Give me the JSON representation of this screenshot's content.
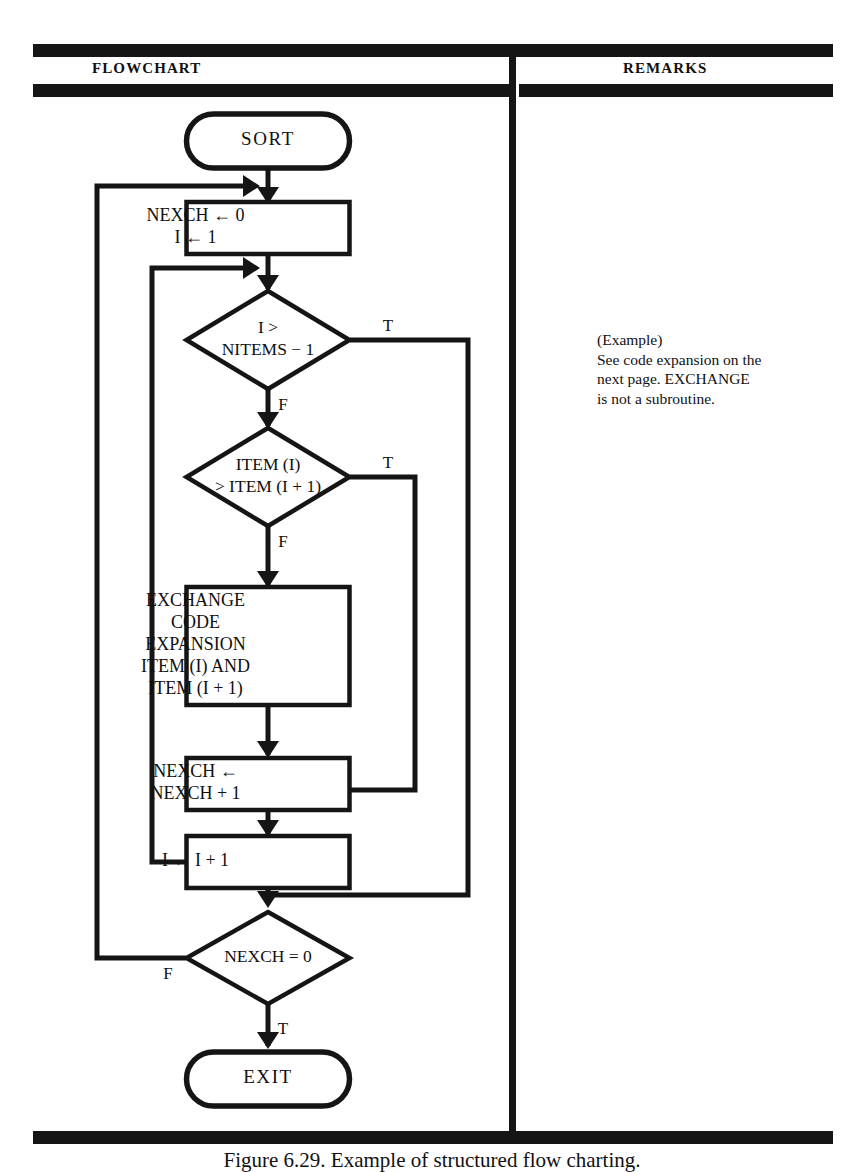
{
  "page": {
    "width": 864,
    "height": 1172,
    "background": "#ffffff",
    "ink_color": "#151515"
  },
  "columns": {
    "flowchart_title": "FLOWCHART",
    "remarks_title": "REMARKS"
  },
  "remarks": {
    "lines": [
      "(Example)",
      "See code expansion on the",
      "next page.  EXCHANGE",
      "is not a subroutine."
    ]
  },
  "figure": {
    "caption": "Figure 6.29.  Example of structured flow charting."
  },
  "chart_data": {
    "type": "diagram",
    "diagram_kind": "flowchart",
    "title": "FLOWCHART",
    "nodes": [
      {
        "id": "start",
        "shape": "terminal",
        "lines": [
          "SORT"
        ],
        "cx": 268,
        "cy": 141,
        "w": 163,
        "h": 54
      },
      {
        "id": "init",
        "shape": "process",
        "lines": [
          "NEXCH ← 0",
          "I ← 1"
        ],
        "cx": 268,
        "cy": 228,
        "w": 163,
        "h": 52
      },
      {
        "id": "loop-test",
        "shape": "decision",
        "lines": [
          "I >",
          "NITEMS − 1"
        ],
        "cx": 268,
        "cy": 340,
        "w": 163,
        "h": 98
      },
      {
        "id": "compare",
        "shape": "decision",
        "lines": [
          "ITEM (I)",
          "> ITEM (I + 1)"
        ],
        "cx": 268,
        "cy": 477,
        "w": 163,
        "h": 98
      },
      {
        "id": "exchange",
        "shape": "process",
        "lines": [
          "EXCHANGE",
          "CODE",
          "EXPANSION",
          "ITEM (I) AND",
          "ITEM (I + 1)"
        ],
        "cx": 268,
        "cy": 646,
        "w": 163,
        "h": 118
      },
      {
        "id": "count",
        "shape": "process",
        "lines": [
          "NEXCH ←",
          "NEXCH + 1"
        ],
        "cx": 268,
        "cy": 784,
        "w": 163,
        "h": 52
      },
      {
        "id": "increment",
        "shape": "process",
        "lines": [
          "I ← I + 1"
        ],
        "cx": 268,
        "cy": 862,
        "w": 163,
        "h": 52
      },
      {
        "id": "done-test",
        "shape": "decision",
        "lines": [
          "NEXCH = 0"
        ],
        "cx": 268,
        "cy": 958,
        "w": 163,
        "h": 92
      },
      {
        "id": "exit",
        "shape": "terminal",
        "lines": [
          "EXIT"
        ],
        "cx": 268,
        "cy": 1079,
        "w": 163,
        "h": 54
      }
    ],
    "branch_labels": [
      {
        "id": "loop-test-true",
        "text": "T",
        "x": 388,
        "y": 327
      },
      {
        "id": "loop-test-false",
        "text": "F",
        "x": 283,
        "y": 406
      },
      {
        "id": "compare-true",
        "text": "T",
        "x": 388,
        "y": 464
      },
      {
        "id": "compare-false",
        "text": "F",
        "x": 283,
        "y": 543
      },
      {
        "id": "done-test-false",
        "text": "F",
        "x": 168,
        "y": 975
      },
      {
        "id": "done-test-true",
        "text": "T",
        "x": 283,
        "y": 1030
      }
    ],
    "edges": [
      {
        "from": "start",
        "to": "init",
        "label": ""
      },
      {
        "from": "init",
        "to": "loop-test",
        "label": ""
      },
      {
        "from": "loop-test",
        "to": "done-test",
        "label": "T"
      },
      {
        "from": "loop-test",
        "to": "compare",
        "label": "F"
      },
      {
        "from": "compare",
        "to": "increment",
        "label": "T"
      },
      {
        "from": "compare",
        "to": "exchange",
        "label": "F"
      },
      {
        "from": "exchange",
        "to": "count",
        "label": ""
      },
      {
        "from": "count",
        "to": "increment",
        "label": ""
      },
      {
        "from": "increment",
        "to": "loop-test",
        "label": "loop back"
      },
      {
        "from": "done-test",
        "to": "init",
        "label": "F"
      },
      {
        "from": "done-test",
        "to": "exit",
        "label": "T"
      }
    ]
  }
}
